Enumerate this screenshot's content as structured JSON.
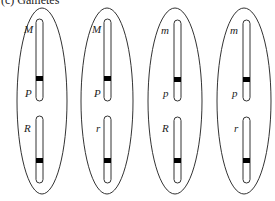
{
  "figure": {
    "caption": "(c) Gametes",
    "colors": {
      "stroke": "#333333",
      "centromere": "#000000",
      "background": "#ffffff"
    },
    "gametes": [
      {
        "cx": 42,
        "chrom_x": 39,
        "labels": {
          "top": "M",
          "mid": "P",
          "lower": "R"
        }
      },
      {
        "cx": 106,
        "chrom_x": 107,
        "labels": {
          "top": "M",
          "mid": "P",
          "lower": "r"
        }
      },
      {
        "cx": 175,
        "chrom_x": 177,
        "labels": {
          "top": "m",
          "mid": "p",
          "lower": "R"
        }
      },
      {
        "cx": 244,
        "chrom_x": 246,
        "labels": {
          "top": "m",
          "mid": "p",
          "lower": "r"
        }
      }
    ]
  }
}
